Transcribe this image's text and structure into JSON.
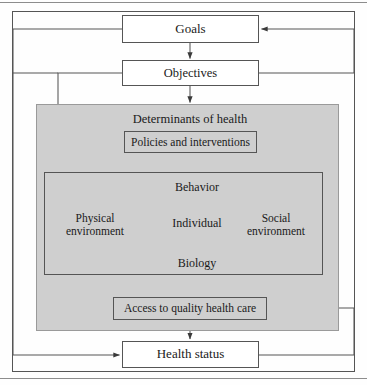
{
  "figure": {
    "colors": {
      "shaded_panel": "#cfcfcf",
      "line": "#555555",
      "text": "#1a1a1a",
      "background": "#ffffff"
    }
  },
  "nodes": {
    "goals": "Goals",
    "objectives": "Objectives",
    "determinants_panel": "Determinants of health",
    "policies": "Policies and interventions",
    "behavior": "Behavior",
    "biology": "Biology",
    "individual": "Individual",
    "physical_environment": "Physical\nenvironment",
    "physical_environment_line1": "Physical",
    "physical_environment_line2": "environment",
    "social_environment_line1": "Social",
    "social_environment_line2": "environment",
    "access": "Access to quality health care",
    "health_status": "Health status"
  },
  "edges": [
    {
      "from": "goals",
      "to": "objectives",
      "label": ""
    },
    {
      "from": "objectives",
      "to": "determinants_panel",
      "label": ""
    },
    {
      "from": "objectives",
      "to": "policies",
      "label": ""
    },
    {
      "from": "policies",
      "to": "individual_panel",
      "label": ""
    },
    {
      "from": "physical_environment",
      "to": "behavior",
      "label": ""
    },
    {
      "from": "physical_environment",
      "to": "biology",
      "label": ""
    },
    {
      "from": "social_environment",
      "to": "behavior",
      "label": ""
    },
    {
      "from": "social_environment",
      "to": "biology",
      "label": ""
    },
    {
      "from": "behavior",
      "to": "biology",
      "label": ""
    },
    {
      "from": "biology",
      "to": "behavior",
      "label": ""
    },
    {
      "from": "access",
      "to": "individual_panel",
      "label": ""
    },
    {
      "from": "access",
      "to": "health_status",
      "label": ""
    },
    {
      "from": "health_status",
      "to": "goals",
      "label": ""
    },
    {
      "from": "health_status",
      "to": "access",
      "label": ""
    }
  ]
}
